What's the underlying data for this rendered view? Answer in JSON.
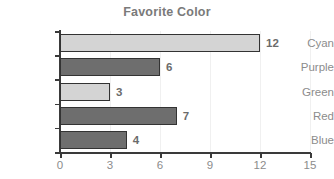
{
  "chart_data": {
    "type": "bar",
    "orientation": "horizontal",
    "title": "Favorite Color",
    "xlabel": "",
    "ylabel": "",
    "categories": [
      "Cyan",
      "Purple",
      "Green",
      "Red",
      "Blue"
    ],
    "values": [
      12,
      6,
      3,
      7,
      4
    ],
    "value_labels": [
      "12",
      "6",
      "3",
      "7",
      "4"
    ],
    "bar_colors": [
      "#d4d4d4",
      "#6e6e6e",
      "#d4d4d4",
      "#6e6e6e",
      "#6e6e6e"
    ],
    "bar_border_color": "#333333",
    "xlim": [
      0,
      15
    ],
    "xticks": [
      0,
      3,
      6,
      9,
      12,
      15
    ],
    "xtick_labels": [
      "0",
      "3",
      "6",
      "9",
      "12",
      "15"
    ],
    "grid": true,
    "grid_axis": "x",
    "legend": false,
    "title_color": "#7a7a7a",
    "tick_label_color": "#8c8c8c",
    "value_label_color": "#6b6b6b",
    "background": "#ffffff"
  }
}
